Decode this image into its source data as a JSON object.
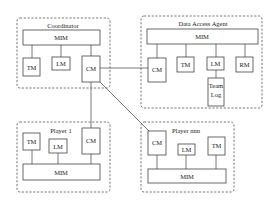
{
  "diagram": {
    "groups": {
      "coordinator": {
        "title": "Coordinator",
        "mim": "MIM",
        "tm": "TM",
        "lm": "LM",
        "cm": "CM"
      },
      "data_access_agent": {
        "title": "Data Access Agent",
        "mim": "MIM",
        "cm": "CM",
        "tm": "TM",
        "lm": "LM",
        "rm": "RM",
        "team_log_line1": "Team",
        "team_log_line2": "Log"
      },
      "player_1": {
        "title": "Player 1",
        "mim": "MIM",
        "tm": "TM",
        "lm": "LM",
        "cm": "CM"
      },
      "player_nnn": {
        "title": "Player nnn",
        "mim": "MIM",
        "cm": "CM",
        "lm": "LM",
        "tm": "TM"
      }
    },
    "connections": [
      {
        "from": "coordinator.CM",
        "to": "data_access_agent.CM"
      },
      {
        "from": "coordinator.CM",
        "to": "player_1.CM"
      },
      {
        "from": "coordinator.CM",
        "to": "player_nnn.CM"
      }
    ]
  }
}
